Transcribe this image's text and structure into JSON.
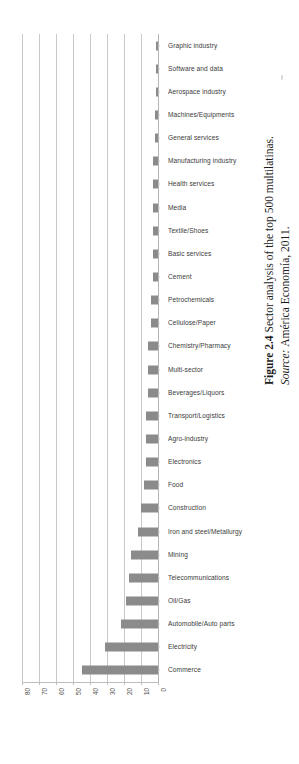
{
  "figure": {
    "caption_label": "Figure 2.4",
    "caption_text": "Sector analysis of the top 500 multilatinas.",
    "source_label": "Source:",
    "source_text": "América Economía, 2011."
  },
  "chart_data": {
    "type": "bar",
    "orientation": "horizontal",
    "title": "Sector analysis of the top 500 multilatinas",
    "xlabel": "",
    "ylabel": "",
    "xlim": [
      80,
      0
    ],
    "x_axis_reversed": true,
    "xticks": [
      80,
      70,
      60,
      50,
      40,
      30,
      20,
      10,
      0
    ],
    "xtick_labels": [
      "80",
      "70",
      "60",
      "50",
      "40",
      "30",
      "20",
      "10",
      "0"
    ],
    "grid": true,
    "grid_axis": "x",
    "legend": false,
    "bar_color": "#8b8b8b",
    "grid_color": "#c9c9c9",
    "categories": [
      "Graphic industry",
      "Software and data",
      "Aerospace industry",
      "Machines/Equipments",
      "General services",
      "Manufacturing industry",
      "Health services",
      "Media",
      "Textile/Shoes",
      "Basic services",
      "Cement",
      "Petrochemicals",
      "Cellulose/Paper",
      "Chemistry/Pharmacy",
      "Multi-sector",
      "Beverages/Liquors",
      "Transport/Logistics",
      "Agro-industry",
      "Electronics",
      "Food",
      "Construction",
      "Iron and steel/Metallurgy",
      "Mining",
      "Telecommunications",
      "Oil/Gas",
      "Automobile/Auto parts",
      "Electricity",
      "Commerce"
    ],
    "values": [
      1,
      1,
      1,
      2,
      2,
      3,
      3,
      3,
      3,
      3,
      3,
      4,
      4,
      6,
      6,
      6,
      7,
      7,
      7,
      8,
      10,
      12,
      16,
      17,
      19,
      22,
      31,
      45
    ]
  }
}
